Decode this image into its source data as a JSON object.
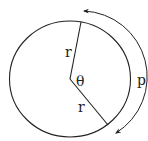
{
  "figure": {
    "labels": {
      "radius_upper": "r",
      "radius_lower": "r",
      "angle": "θ",
      "arc": "p"
    },
    "colors": {
      "stroke": "#222222",
      "background": "#ffffff"
    }
  }
}
